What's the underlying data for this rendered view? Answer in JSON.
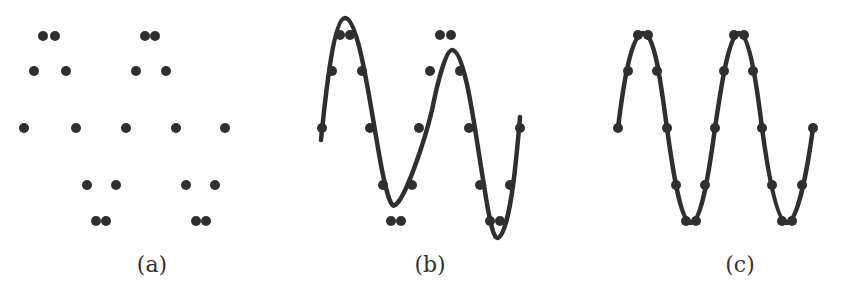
{
  "figure": {
    "panels": [
      {
        "id": "a",
        "label": "(a)",
        "label_x": 152,
        "show_curve": false,
        "points": [
          [
            24,
            128
          ],
          [
            34,
            71
          ],
          [
            43,
            36
          ],
          [
            55,
            36
          ],
          [
            66,
            71
          ],
          [
            76,
            128
          ],
          [
            87,
            185
          ],
          [
            96,
            221
          ],
          [
            106,
            221
          ],
          [
            116,
            185
          ],
          [
            126,
            128
          ],
          [
            136,
            71
          ],
          [
            145,
            36
          ],
          [
            155,
            36
          ],
          [
            166,
            71
          ],
          [
            176,
            128
          ],
          [
            186,
            185
          ],
          [
            196,
            221
          ],
          [
            206,
            221
          ],
          [
            215,
            185
          ],
          [
            225,
            128
          ]
        ]
      },
      {
        "id": "b",
        "label": "(b)",
        "label_x": 430,
        "show_curve": true,
        "curve_path": "M321,140 C326,90 334,18 345,18 C360,18 372,120 382,170 C388,200 392,208 395,205 C405,200 425,140 432,110 C438,80 446,50 452,50 C466,50 476,140 484,185 C490,225 494,238 497,238 C505,238 512,200 516,160 C519,130 520,120 520,117",
        "points": [
          [
            322,
            128
          ],
          [
            332,
            71
          ],
          [
            340,
            35
          ],
          [
            350,
            35
          ],
          [
            362,
            71
          ],
          [
            370,
            128
          ],
          [
            383,
            185
          ],
          [
            391,
            221
          ],
          [
            401,
            221
          ],
          [
            412,
            185
          ],
          [
            419,
            128
          ],
          [
            430,
            71
          ],
          [
            440,
            35
          ],
          [
            451,
            35
          ],
          [
            460,
            71
          ],
          [
            469,
            128
          ],
          [
            480,
            185
          ],
          [
            490,
            221
          ],
          [
            500,
            221
          ],
          [
            510,
            185
          ],
          [
            520,
            128
          ]
        ]
      },
      {
        "id": "c",
        "label": "(c)",
        "label_x": 740,
        "show_curve": true,
        "curve_path": "M618,128 C622,95 630,35 643,33 C656,33 662,95 667,128 C672,165 680,222 691,223 C702,222 710,165 715,128 C720,95 728,35 739,33 C750,33 758,95 762,128 C767,165 776,222 787,223 C798,222 808,165 813,128",
        "points": [
          [
            618,
            128
          ],
          [
            628,
            71
          ],
          [
            638,
            35
          ],
          [
            648,
            35
          ],
          [
            657,
            71
          ],
          [
            667,
            128
          ],
          [
            676,
            185
          ],
          [
            686,
            221
          ],
          [
            696,
            221
          ],
          [
            705,
            185
          ],
          [
            715,
            128
          ],
          [
            724,
            71
          ],
          [
            734,
            35
          ],
          [
            744,
            35
          ],
          [
            753,
            71
          ],
          [
            762,
            128
          ],
          [
            772,
            185
          ],
          [
            782,
            221
          ],
          [
            792,
            221
          ],
          [
            802,
            185
          ],
          [
            813,
            128
          ]
        ]
      }
    ],
    "colors": {
      "ink": "#2f2f2f",
      "background": "#ffffff"
    },
    "dot_radius": 5
  }
}
